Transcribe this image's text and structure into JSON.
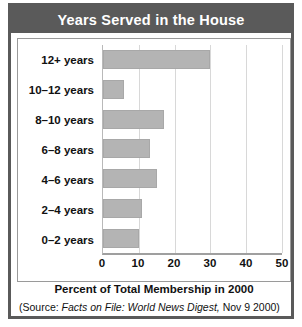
{
  "title": "Years Served in the House",
  "source": {
    "prefix": "(Source: ",
    "publication": "Facts on File: World News Digest,",
    "suffix": " Nov 9 2000)"
  },
  "colors": {
    "title_band": "#5a5a5a",
    "frame": "#5a5a5a",
    "bar_fill": "#b4b4b4",
    "bar_stroke": "#a8a8a8",
    "gridline": "#d8d8d8",
    "axis": "#9f9f9f",
    "text": "#111111",
    "title_text": "#ffffff"
  },
  "chart_data": {
    "type": "bar",
    "orientation": "horizontal",
    "title": "Years Served in the House",
    "xlabel": "Percent of Total Membership in 2000",
    "ylabel": "",
    "categories": [
      "12+ years",
      "10–12 years",
      "8–10 years",
      "6–8 years",
      "4–6 years",
      "2–4 years",
      "0–2 years"
    ],
    "values": [
      30,
      6,
      17,
      13,
      15,
      11,
      10
    ],
    "xlim": [
      0,
      50
    ],
    "xticks": [
      0,
      10,
      20,
      30,
      40,
      50
    ],
    "xtick_labels": [
      "0",
      "10",
      "20",
      "30",
      "40",
      "50"
    ],
    "grid": true,
    "grid_axis": "x",
    "legend": false
  }
}
